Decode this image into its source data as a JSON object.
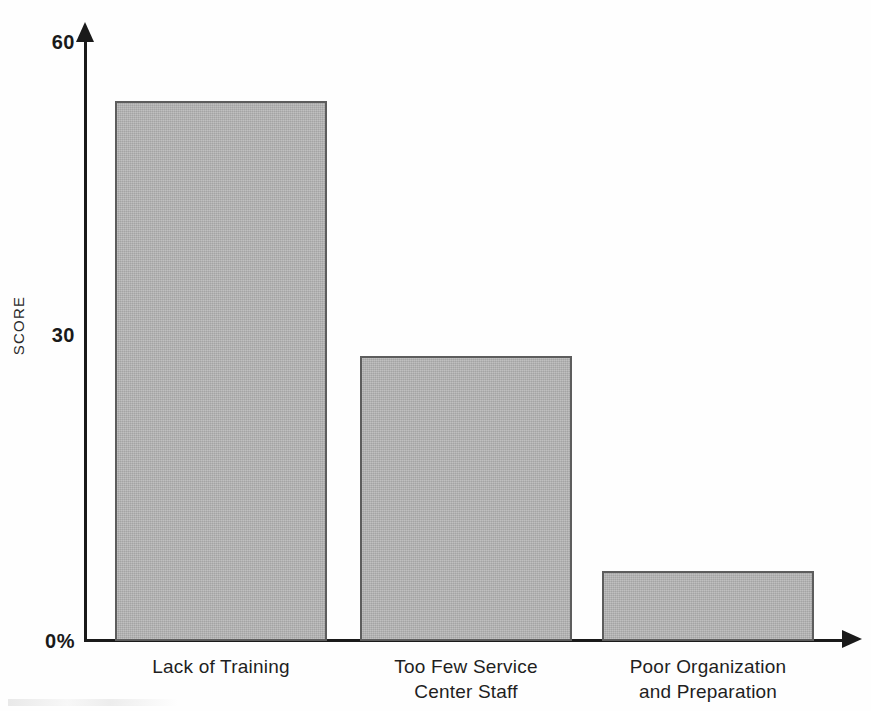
{
  "chart_data": {
    "type": "bar",
    "title": "",
    "xlabel": "",
    "ylabel": "SCORE",
    "categories": [
      "Lack of Training",
      "Too Few Service\nCenter Staff",
      "Poor Organization\nand Preparation"
    ],
    "values": [
      54,
      28.5,
      7
    ],
    "ylim": [
      0,
      60
    ],
    "yticks": [
      "0%",
      "30",
      "60"
    ],
    "ytick_values": [
      0,
      30,
      60
    ],
    "grid": false,
    "legend": false,
    "bar_color": "#b2b2b2",
    "bar_border_color": "#5d5d5d",
    "axis_color": "#1a1a1a"
  },
  "axis": {
    "y_title": "SCORE",
    "ticks": {
      "top": "60",
      "middle": "30",
      "bottom": "0%"
    }
  },
  "bars": [
    {
      "label": "Lack of Training",
      "value": 54
    },
    {
      "label": "Too Few Service\nCenter Staff",
      "value": 28.5
    },
    {
      "label": "Poor Organization\nand Preparation",
      "value": 7
    }
  ]
}
